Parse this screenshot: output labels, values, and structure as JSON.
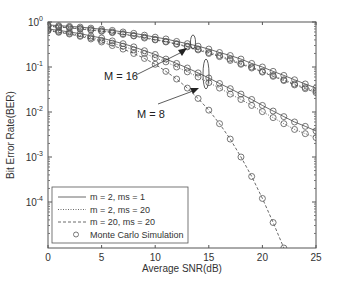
{
  "chart_data": {
    "type": "line",
    "title": "",
    "xlabel": "Average SNR(dB)",
    "ylabel": "Bit Error Rate(BER)",
    "xlim": [
      0,
      25
    ],
    "ylim": [
      1e-05,
      1
    ],
    "yscale": "log",
    "grid": false,
    "x_ticks": [
      0,
      5,
      10,
      15,
      20,
      25
    ],
    "y_ticks": [
      "10^0",
      "10^-1",
      "10^-2",
      "10^-3",
      "10^-4"
    ],
    "legend_position": "lower left",
    "legend": [
      {
        "label": "m = 2, ms = 1",
        "style": "solid"
      },
      {
        "label": "m = 2, ms = 20",
        "style": "dotted"
      },
      {
        "label": "m = 20, ms = 20",
        "style": "dashed"
      },
      {
        "label": "Monte Carlo Simulation",
        "style": "marker-circle"
      }
    ],
    "annotations": [
      {
        "text": "M = 16",
        "target_snr": 14
      },
      {
        "text": "M = 8",
        "target_snr": 15
      }
    ],
    "x": [
      0,
      1,
      2,
      3,
      4,
      5,
      6,
      7,
      8,
      9,
      10,
      11,
      12,
      13,
      14,
      15,
      16,
      17,
      18,
      19,
      20,
      21,
      22,
      23,
      24,
      25
    ],
    "series": [
      {
        "name": "M = 16, m = 2, ms = 1",
        "style": "solid",
        "values": [
          0.86,
          0.83,
          0.8,
          0.77,
          0.73,
          0.69,
          0.65,
          0.6,
          0.56,
          0.51,
          0.46,
          0.42,
          0.37,
          0.33,
          0.29,
          0.25,
          0.21,
          0.18,
          0.15,
          0.12,
          0.1,
          0.08,
          0.065,
          0.052,
          0.042,
          0.034
        ]
      },
      {
        "name": "M = 16, m = 2, ms = 20",
        "style": "dotted",
        "values": [
          0.82,
          0.79,
          0.76,
          0.72,
          0.68,
          0.64,
          0.6,
          0.55,
          0.5,
          0.46,
          0.41,
          0.37,
          0.33,
          0.29,
          0.25,
          0.21,
          0.18,
          0.15,
          0.12,
          0.1,
          0.08,
          0.065,
          0.052,
          0.042,
          0.035,
          0.029
        ]
      },
      {
        "name": "M = 16, m = 20, ms = 20",
        "style": "dashed",
        "values": [
          0.8,
          0.77,
          0.74,
          0.7,
          0.66,
          0.62,
          0.58,
          0.53,
          0.49,
          0.44,
          0.4,
          0.36,
          0.32,
          0.28,
          0.24,
          0.2,
          0.17,
          0.14,
          0.115,
          0.095,
          0.077,
          0.062,
          0.05,
          0.04,
          0.033,
          0.027
        ]
      },
      {
        "name": "M = 8, m = 2, ms = 1",
        "style": "solid",
        "values": [
          0.7,
          0.65,
          0.6,
          0.55,
          0.49,
          0.44,
          0.38,
          0.33,
          0.28,
          0.23,
          0.19,
          0.15,
          0.12,
          0.095,
          0.074,
          0.057,
          0.043,
          0.033,
          0.025,
          0.019,
          0.014,
          0.0105,
          0.0079,
          0.006,
          0.0048,
          0.0038
        ]
      },
      {
        "name": "M = 8, m = 2, ms = 20",
        "style": "dotted",
        "values": [
          0.66,
          0.61,
          0.56,
          0.5,
          0.45,
          0.39,
          0.34,
          0.29,
          0.24,
          0.2,
          0.16,
          0.13,
          0.1,
          0.078,
          0.06,
          0.045,
          0.034,
          0.025,
          0.019,
          0.014,
          0.0102,
          0.0075,
          0.0055,
          0.0041,
          0.0033,
          0.0027
        ]
      },
      {
        "name": "M = 8, m = 20, ms = 20",
        "style": "dashed",
        "values": [
          0.64,
          0.59,
          0.54,
          0.48,
          0.42,
          0.36,
          0.3,
          0.25,
          0.2,
          0.155,
          0.115,
          0.08,
          0.054,
          0.034,
          0.02,
          0.011,
          0.0055,
          0.0025,
          0.001,
          0.00037,
          0.00012,
          3.5e-05,
          9.5e-06,
          2e-06,
          null,
          null
        ]
      }
    ]
  }
}
